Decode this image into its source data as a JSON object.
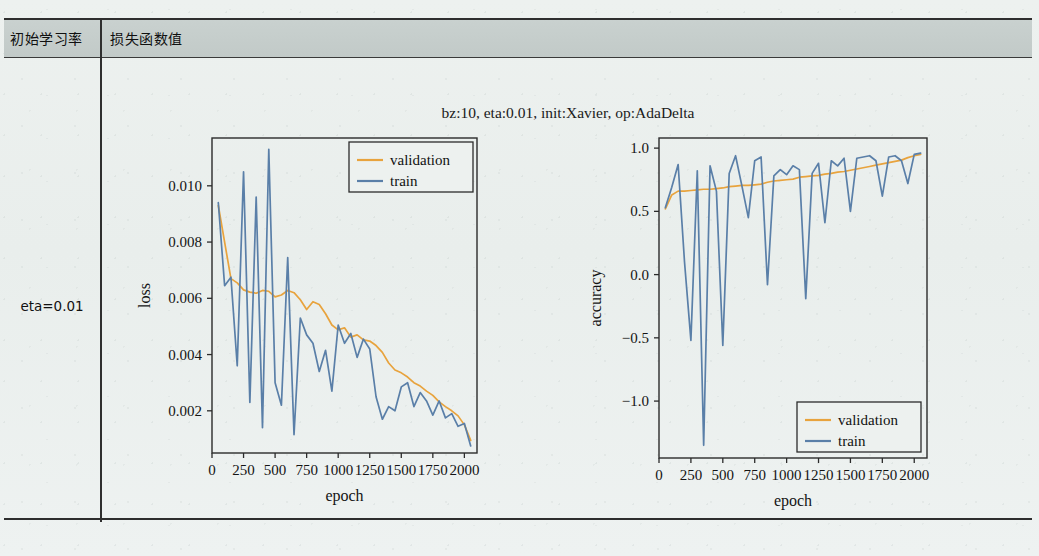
{
  "table": {
    "header": {
      "col1": "初始学习率",
      "col2": "损失函数值"
    },
    "row_label": "eta=0.01"
  },
  "figure": {
    "title": "bz:10, eta:0.01, init:Xavier, op:AdaDelta",
    "colors": {
      "validation": "#e8a33d",
      "train": "#5a7fa8",
      "axis": "#2b2b2b",
      "background": "#edf1ef",
      "header_fill": "#c6cecc"
    }
  },
  "chart_data": [
    {
      "type": "line",
      "id": "loss-chart",
      "title": "",
      "xlabel": "epoch",
      "ylabel": "loss",
      "xlim": [
        0,
        2100
      ],
      "ylim": [
        0.0005,
        0.0117
      ],
      "xticks": [
        0,
        250,
        500,
        750,
        1000,
        1250,
        1500,
        1750,
        2000
      ],
      "yticks": [
        0.002,
        0.004,
        0.006,
        0.008,
        0.01
      ],
      "ytick_labels": [
        "0.002",
        "0.004",
        "0.006",
        "0.008",
        "0.010"
      ],
      "grid": false,
      "legend_position": "top-right",
      "legend": [
        "validation",
        "train"
      ],
      "x": [
        50,
        100,
        150,
        200,
        250,
        300,
        350,
        400,
        450,
        500,
        550,
        600,
        650,
        700,
        750,
        800,
        850,
        900,
        950,
        1000,
        1050,
        1100,
        1150,
        1200,
        1250,
        1300,
        1350,
        1400,
        1450,
        1500,
        1550,
        1600,
        1650,
        1700,
        1750,
        1800,
        1850,
        1900,
        1950,
        2000,
        2050
      ],
      "series": [
        {
          "name": "validation",
          "color": "#e8a33d",
          "values": [
            0.0093,
            0.008,
            0.0067,
            0.00655,
            0.0063,
            0.00622,
            0.00618,
            0.00628,
            0.00625,
            0.00605,
            0.00612,
            0.00628,
            0.0062,
            0.00595,
            0.0056,
            0.00588,
            0.00578,
            0.00545,
            0.00505,
            0.00488,
            0.00495,
            0.00462,
            0.0047,
            0.00452,
            0.00448,
            0.00432,
            0.00408,
            0.0037,
            0.00345,
            0.00335,
            0.0032,
            0.003,
            0.00288,
            0.0027,
            0.00255,
            0.00232,
            0.00215,
            0.002,
            0.00182,
            0.0015,
            0.00095
          ]
        },
        {
          "name": "train",
          "color": "#5a7fa8",
          "values": [
            0.0094,
            0.00645,
            0.00675,
            0.0036,
            0.0105,
            0.0023,
            0.0096,
            0.0014,
            0.0113,
            0.003,
            0.0022,
            0.00745,
            0.00115,
            0.0053,
            0.0047,
            0.0044,
            0.0034,
            0.00415,
            0.0027,
            0.00505,
            0.0044,
            0.00475,
            0.0039,
            0.00455,
            0.0042,
            0.0025,
            0.0017,
            0.00215,
            0.002,
            0.00285,
            0.003,
            0.00215,
            0.00265,
            0.00235,
            0.00185,
            0.00235,
            0.00175,
            0.0019,
            0.00145,
            0.00155,
            0.00075
          ]
        }
      ]
    },
    {
      "type": "line",
      "id": "accuracy-chart",
      "title": "",
      "xlabel": "epoch",
      "ylabel": "accuracy",
      "xlim": [
        0,
        2100
      ],
      "ylim": [
        -1.45,
        1.08
      ],
      "xticks": [
        0,
        250,
        500,
        750,
        1000,
        1250,
        1500,
        1750,
        2000
      ],
      "yticks": [
        -1.0,
        -0.5,
        0.0,
        0.5,
        1.0
      ],
      "ytick_labels": [
        "−1.0",
        "−0.5",
        "0.0",
        "0.5",
        "1.0"
      ],
      "grid": false,
      "legend_position": "bottom-right",
      "legend": [
        "validation",
        "train"
      ],
      "x": [
        50,
        100,
        150,
        200,
        250,
        300,
        350,
        400,
        450,
        500,
        550,
        600,
        650,
        700,
        750,
        800,
        850,
        900,
        950,
        1000,
        1050,
        1100,
        1150,
        1200,
        1250,
        1300,
        1350,
        1400,
        1450,
        1500,
        1550,
        1600,
        1650,
        1700,
        1750,
        1800,
        1850,
        1900,
        1950,
        2000,
        2050
      ],
      "series": [
        {
          "name": "validation",
          "color": "#e8a33d",
          "values": [
            0.52,
            0.63,
            0.66,
            0.66,
            0.665,
            0.67,
            0.675,
            0.675,
            0.68,
            0.685,
            0.695,
            0.7,
            0.705,
            0.705,
            0.71,
            0.715,
            0.73,
            0.74,
            0.745,
            0.75,
            0.755,
            0.77,
            0.775,
            0.78,
            0.785,
            0.795,
            0.8,
            0.81,
            0.815,
            0.825,
            0.835,
            0.845,
            0.855,
            0.865,
            0.875,
            0.885,
            0.895,
            0.905,
            0.925,
            0.94,
            0.95
          ]
        },
        {
          "name": "train",
          "color": "#5a7fa8",
          "values": [
            0.53,
            0.69,
            0.87,
            0.1,
            -0.52,
            0.82,
            -1.35,
            0.86,
            0.66,
            -0.56,
            0.8,
            0.94,
            0.7,
            0.45,
            0.9,
            0.93,
            -0.08,
            0.78,
            0.83,
            0.79,
            0.86,
            0.83,
            -0.19,
            0.8,
            0.88,
            0.41,
            0.9,
            0.86,
            0.92,
            0.5,
            0.92,
            0.93,
            0.94,
            0.9,
            0.62,
            0.93,
            0.94,
            0.9,
            0.72,
            0.95,
            0.96
          ]
        }
      ]
    }
  ]
}
